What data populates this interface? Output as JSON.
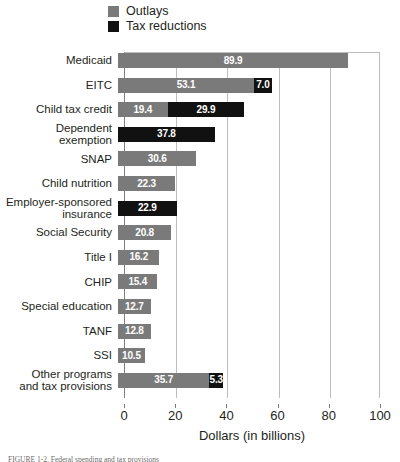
{
  "legend": {
    "position": "top-left",
    "items": [
      {
        "label": "Outlays",
        "color": "#7a7a7a",
        "key": "outlays"
      },
      {
        "label": "Tax reductions",
        "color": "#111111",
        "key": "tax_reductions"
      }
    ]
  },
  "axis": {
    "xlabel": "Dollars (in billions)",
    "ticks": [
      0,
      20,
      40,
      60,
      80,
      100
    ],
    "tick_labels": [
      "0",
      "20",
      "40",
      "60",
      "80",
      "100"
    ]
  },
  "caption": "FIGURE 1-2. Federal spending and tax provisions",
  "chart_data": {
    "type": "bar",
    "orientation": "horizontal",
    "stacked": true,
    "title": "",
    "xlabel": "Dollars (in billions)",
    "ylabel": "",
    "xlim": [
      0,
      100
    ],
    "grid": true,
    "grid_axis": "x",
    "legend_position": "top-left",
    "categories": [
      "Medicaid",
      "EITC",
      "Child tax credit",
      "Dependent exemption",
      "SNAP",
      "Child nutrition",
      "Employer-sponsored insurance",
      "Social Security",
      "Title I",
      "CHIP",
      "Special education",
      "TANF",
      "SSI",
      "Other programs and tax provisions"
    ],
    "series": [
      {
        "name": "Outlays",
        "color": "#7a7a7a",
        "values": [
          89.9,
          53.1,
          19.4,
          0,
          30.6,
          22.3,
          0,
          20.8,
          16.2,
          15.4,
          12.7,
          12.8,
          10.5,
          35.7
        ]
      },
      {
        "name": "Tax reductions",
        "color": "#111111",
        "values": [
          0,
          7.0,
          29.9,
          37.8,
          0,
          0,
          22.9,
          0,
          0,
          0,
          0,
          0,
          0,
          5.3
        ]
      }
    ],
    "bars": [
      {
        "category": "Medicaid",
        "label_lines": [
          "Medicaid"
        ],
        "segments": [
          {
            "series": "Outlays",
            "value": 89.9,
            "label": "89.9"
          }
        ]
      },
      {
        "category": "EITC",
        "label_lines": [
          "EITC"
        ],
        "segments": [
          {
            "series": "Outlays",
            "value": 53.1,
            "label": "53.1"
          },
          {
            "series": "Tax reductions",
            "value": 7.0,
            "label": "7.0"
          }
        ]
      },
      {
        "category": "Child tax credit",
        "label_lines": [
          "Child tax credit"
        ],
        "segments": [
          {
            "series": "Outlays",
            "value": 19.4,
            "label": "19.4"
          },
          {
            "series": "Tax reductions",
            "value": 29.9,
            "label": "29.9"
          }
        ]
      },
      {
        "category": "Dependent exemption",
        "label_lines": [
          "Dependent exemption"
        ],
        "segments": [
          {
            "series": "Tax reductions",
            "value": 37.8,
            "label": "37.8"
          }
        ]
      },
      {
        "category": "SNAP",
        "label_lines": [
          "SNAP"
        ],
        "segments": [
          {
            "series": "Outlays",
            "value": 30.6,
            "label": "30.6"
          }
        ]
      },
      {
        "category": "Child nutrition",
        "label_lines": [
          "Child nutrition"
        ],
        "segments": [
          {
            "series": "Outlays",
            "value": 22.3,
            "label": "22.3"
          }
        ]
      },
      {
        "category": "Employer-sponsored insurance",
        "label_lines": [
          "Employer-sponsored",
          "insurance"
        ],
        "segments": [
          {
            "series": "Tax reductions",
            "value": 22.9,
            "label": "22.9"
          }
        ]
      },
      {
        "category": "Social Security",
        "label_lines": [
          "Social Security"
        ],
        "segments": [
          {
            "series": "Outlays",
            "value": 20.8,
            "label": "20.8"
          }
        ]
      },
      {
        "category": "Title I",
        "label_lines": [
          "Title I"
        ],
        "segments": [
          {
            "series": "Outlays",
            "value": 16.2,
            "label": "16.2"
          }
        ]
      },
      {
        "category": "CHIP",
        "label_lines": [
          "CHIP"
        ],
        "segments": [
          {
            "series": "Outlays",
            "value": 15.4,
            "label": "15.4"
          }
        ]
      },
      {
        "category": "Special education",
        "label_lines": [
          "Special education"
        ],
        "segments": [
          {
            "series": "Outlays",
            "value": 12.7,
            "label": "12.7"
          }
        ]
      },
      {
        "category": "TANF",
        "label_lines": [
          "TANF"
        ],
        "segments": [
          {
            "series": "Outlays",
            "value": 12.8,
            "label": "12.8"
          }
        ]
      },
      {
        "category": "SSI",
        "label_lines": [
          "SSI"
        ],
        "segments": [
          {
            "series": "Outlays",
            "value": 10.5,
            "label": "10.5"
          }
        ]
      },
      {
        "category": "Other programs and tax provisions",
        "label_lines": [
          "Other programs",
          "and tax provisions"
        ],
        "segments": [
          {
            "series": "Outlays",
            "value": 35.7,
            "label": "35.7"
          },
          {
            "series": "Tax reductions",
            "value": 5.3,
            "label": "5.3"
          }
        ]
      }
    ]
  }
}
